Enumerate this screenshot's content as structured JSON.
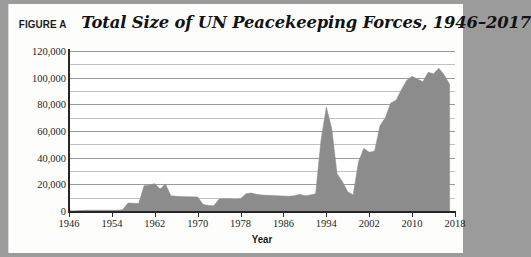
{
  "figure": {
    "label": "FIGURE A",
    "title": "Total Size of UN Peacekeeping Forces, 1946–2017"
  },
  "colors": {
    "area_fill": "#8c8c8c",
    "axis": "#262626",
    "gridline_major": "#9a9a9a",
    "gridline_minor": "#c2c2c2",
    "plot_background": "#ffffff",
    "card_background": "#fdfdfc",
    "page_background": "#9b9b9b",
    "text": "#1d1d1d"
  },
  "chart_data": {
    "type": "area",
    "title": "Total Size of UN Peacekeeping Forces, 1946–2017",
    "xlabel": "Year",
    "ylabel": "",
    "xlim": [
      1946,
      2018
    ],
    "ylim": [
      0,
      120000
    ],
    "grid": true,
    "legend": null,
    "ytick_labels": [
      "0",
      "20,000",
      "40,000",
      "60,000",
      "80,000",
      "100,000",
      "120,000"
    ],
    "ytick_values": [
      0,
      20000,
      40000,
      60000,
      80000,
      100000,
      120000
    ],
    "ygrid_step": 10000,
    "xtick_labels": [
      "1946",
      "1954",
      "1962",
      "1970",
      "1978",
      "1986",
      "1994",
      "2002",
      "2010",
      "2018"
    ],
    "xtick_values": [
      1946,
      1954,
      1962,
      1970,
      1978,
      1986,
      1994,
      2002,
      2010,
      2018
    ],
    "x": [
      1946,
      1947,
      1948,
      1949,
      1950,
      1951,
      1952,
      1953,
      1954,
      1955,
      1956,
      1957,
      1958,
      1959,
      1960,
      1961,
      1962,
      1963,
      1964,
      1965,
      1966,
      1967,
      1968,
      1969,
      1970,
      1971,
      1972,
      1973,
      1974,
      1975,
      1976,
      1977,
      1978,
      1979,
      1980,
      1981,
      1982,
      1983,
      1984,
      1985,
      1986,
      1987,
      1988,
      1989,
      1990,
      1991,
      1992,
      1993,
      1994,
      1995,
      1996,
      1997,
      1998,
      1999,
      2000,
      2001,
      2002,
      2003,
      2004,
      2005,
      2006,
      2007,
      2008,
      2009,
      2010,
      2011,
      2012,
      2013,
      2014,
      2015,
      2016,
      2017
    ],
    "values": [
      0,
      0,
      300,
      600,
      600,
      600,
      600,
      600,
      600,
      600,
      1000,
      6000,
      5800,
      5600,
      19000,
      19500,
      20500,
      16500,
      20300,
      11500,
      11000,
      10800,
      10700,
      10600,
      10500,
      5000,
      4200,
      4000,
      9000,
      9200,
      9100,
      9000,
      9200,
      13000,
      13500,
      12500,
      12000,
      11800,
      11600,
      11400,
      11200,
      11000,
      11500,
      12500,
      11500,
      12000,
      13000,
      53000,
      78000,
      62000,
      28000,
      22000,
      14500,
      12000,
      37000,
      47000,
      44000,
      45000,
      64000,
      70000,
      81000,
      83000,
      91000,
      98000,
      101000,
      99000,
      97000,
      104000,
      103000,
      107000,
      102000,
      95000
    ]
  }
}
